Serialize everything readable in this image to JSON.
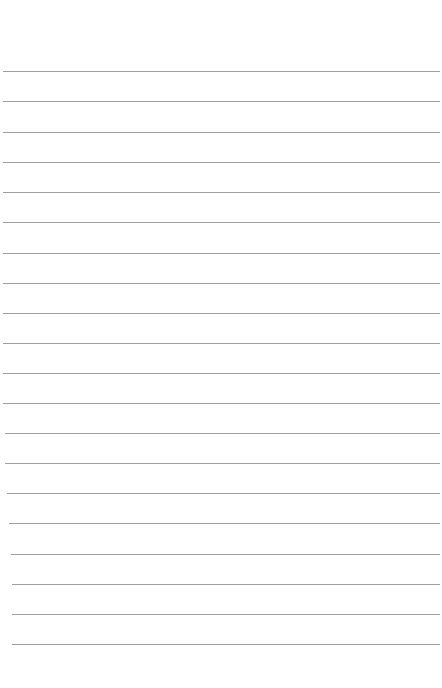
{
  "page": {
    "type": "ruled-paper",
    "background": "#ffffff",
    "line_color": "#8e8e8e",
    "lines": [
      {
        "y": 71,
        "x1": 3,
        "x2": 440
      },
      {
        "y": 101,
        "x1": 3,
        "x2": 440
      },
      {
        "y": 132,
        "x1": 3,
        "x2": 440
      },
      {
        "y": 162,
        "x1": 3,
        "x2": 440
      },
      {
        "y": 192,
        "x1": 3,
        "x2": 440
      },
      {
        "y": 222,
        "x1": 3,
        "x2": 440
      },
      {
        "y": 253,
        "x1": 3,
        "x2": 440
      },
      {
        "y": 283,
        "x1": 3,
        "x2": 440
      },
      {
        "y": 313,
        "x1": 3,
        "x2": 440
      },
      {
        "y": 343,
        "x1": 3,
        "x2": 440
      },
      {
        "y": 373,
        "x1": 3,
        "x2": 440
      },
      {
        "y": 403,
        "x1": 3,
        "x2": 440
      },
      {
        "y": 433,
        "x1": 5,
        "x2": 440
      },
      {
        "y": 463,
        "x1": 5,
        "x2": 440
      },
      {
        "y": 493,
        "x1": 7,
        "x2": 440
      },
      {
        "y": 523,
        "x1": 9,
        "x2": 440
      },
      {
        "y": 554,
        "x1": 11,
        "x2": 440
      },
      {
        "y": 584,
        "x1": 12,
        "x2": 440
      },
      {
        "y": 614,
        "x1": 12,
        "x2": 440
      },
      {
        "y": 644,
        "x1": 12,
        "x2": 440
      }
    ]
  }
}
